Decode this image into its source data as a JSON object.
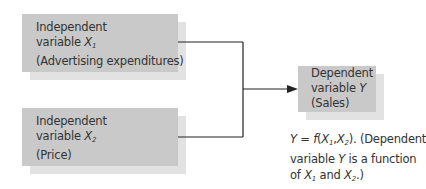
{
  "boxes": {
    "x1": {
      "line1": "Independent",
      "line2_prefix": "variable ",
      "var": "X",
      "sub": "1",
      "line3": "(Advertising expenditures)"
    },
    "x2": {
      "line1": "Independent",
      "line2_prefix": "variable ",
      "var": "X",
      "sub": "2",
      "line3": "(Price)"
    },
    "y": {
      "line1": "Dependent",
      "line2_prefix": "variable ",
      "var": "Y",
      "line3": "(Sales)"
    }
  },
  "caption": {
    "eq_y": "Y",
    "eq_mid": " = ",
    "eq_f": "f",
    "eq_open": "(",
    "x": "X",
    "sub1": "1",
    "comma": ",",
    "sub2": "2",
    "eq_close": "). (Dependent",
    "line2_prefix": "variable ",
    "line2_var": "Y",
    "line2_suffix": " is a function",
    "line3_prefix": "of ",
    "line3_and": " and ",
    "line3_suffix": ".)"
  },
  "colors": {
    "box": "#c9c9c9",
    "shadow": "#e2e2e2",
    "line": "#222222"
  }
}
